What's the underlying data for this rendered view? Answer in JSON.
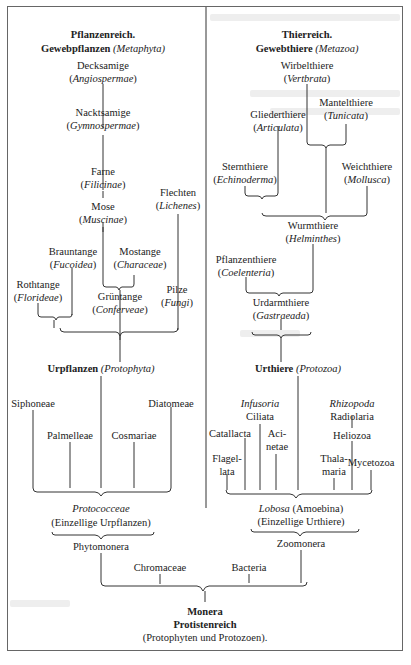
{
  "diagram": {
    "left_root": {
      "title": "Pflanzenreich.",
      "subtitle": "Gewebpflanzen",
      "subtitle_latin": "(Metaphyta)"
    },
    "right_root": {
      "title": "Thierreich.",
      "subtitle": "Gewebthiere",
      "subtitle_latin": "(Metazoa)"
    },
    "plants": [
      {
        "name": "Decksamige",
        "latin": "Angiospermae"
      },
      {
        "name": "Nacktsamige",
        "latin": "Gymnospermae"
      },
      {
        "name": "Farne",
        "latin": "Filicinae"
      },
      {
        "name": "Mose",
        "latin": "Muscinae"
      },
      {
        "name": "Flechten",
        "latin": "Lichenes"
      },
      {
        "name": "Brauntange",
        "latin": "Fucoidea"
      },
      {
        "name": "Mostange",
        "latin": "Characeae"
      },
      {
        "name": "Rothtange",
        "latin": "Florideae"
      },
      {
        "name": "Grüntange",
        "latin": "Conferveae"
      },
      {
        "name": "Pilze",
        "latin": "Fungi"
      }
    ],
    "animals": [
      {
        "name": "Wirbelthiere",
        "latin": "Vertbrata"
      },
      {
        "name": "Mantelthiere",
        "latin": "Tunicata"
      },
      {
        "name": "Gliederthiere",
        "latin": "Articulata"
      },
      {
        "name": "Sternthiere",
        "latin": "Echinoderma"
      },
      {
        "name": "Weichthiere",
        "latin": "Mollusca"
      },
      {
        "name": "Wurmthiere",
        "latin": "Helminthes"
      },
      {
        "name": "Pflanzenthiere",
        "latin": "Coelenteria"
      },
      {
        "name": "Urdarmthiere",
        "latin": "Gastraeada"
      }
    ],
    "protophyta": {
      "name": "Urpflanzen",
      "latin": "(Protophyta)",
      "groups": [
        "Siphoneae",
        "Palmelleae",
        "Cosmariae",
        "Diatomeae"
      ],
      "base_latin": "Protococceae",
      "base_desc": "(Einzellige Urpflanzen)",
      "monera": "Phytomonera"
    },
    "protozoa": {
      "name": "Urthiere",
      "latin": "(Protozoa)",
      "infusoria": "Infusoria",
      "ciliata": "Ciliata",
      "rhizopoda": "Rhizopoda",
      "radiolaria": "Radiolaria",
      "catallacta": "Catallacta",
      "acinetae_1": "Aci-",
      "acinetae_2": "netae",
      "heliozoa": "Heliozoa",
      "flagellata_1": "Flagel-",
      "flagellata_2": "lata",
      "thalamaria_1": "Thala-",
      "thalamaria_2": "maria",
      "mycetozoa": "Mycetozoa",
      "base_latin": "Lobosa",
      "base_name": "(Amoebina)",
      "base_desc": "(Einzellige Urthiere)",
      "monera": "Zoomonera"
    },
    "shared": {
      "chromaceae": "Chromaceae",
      "bacteria": "Bacteria",
      "root_1": "Monera",
      "root_2": "Protistenreich",
      "root_3": "(Protophyten und Protozoen)."
    },
    "colors": {
      "line": "#333333",
      "frame": "#666666",
      "text": "#222222"
    }
  }
}
